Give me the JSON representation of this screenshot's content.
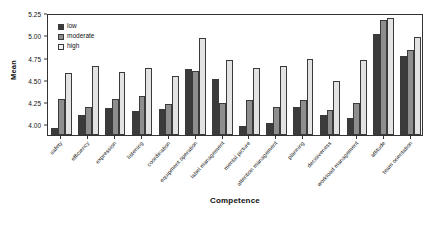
{
  "chart_data": {
    "type": "bar",
    "title": "",
    "xlabel": "Competence",
    "ylabel": "Mean",
    "ylim": [
      3.88,
      5.25
    ],
    "yticks": [
      "4.00",
      "4.25",
      "4.50",
      "4.75",
      "5.00",
      "5.25"
    ],
    "ytick_values": [
      4.0,
      4.25,
      4.5,
      4.75,
      5.0,
      5.25
    ],
    "grid": false,
    "legend_position": "top-left",
    "categories": [
      "safety",
      "efficiency",
      "expression",
      "listening",
      "coordination",
      "equipment operation",
      "label management",
      "mental picture",
      "attention management",
      "planning",
      "decisiveness",
      "workload management",
      "attitude",
      "team orientation"
    ],
    "series": [
      {
        "name": "low",
        "color": "#3b3b3b",
        "values": [
          3.96,
          4.1,
          4.18,
          4.15,
          4.17,
          4.62,
          4.51,
          3.98,
          4.02,
          4.19,
          4.11,
          4.07,
          5.01,
          4.77
        ]
      },
      {
        "name": "moderate",
        "color": "#8e8e8e",
        "values": [
          4.28,
          4.2,
          4.29,
          4.32,
          4.23,
          4.6,
          4.24,
          4.27,
          4.19,
          4.27,
          4.16,
          4.24,
          5.17,
          4.84
        ]
      },
      {
        "name": "high",
        "color": "#e3e3e3",
        "values": [
          4.58,
          4.65,
          4.59,
          4.63,
          4.54,
          4.97,
          4.72,
          4.63,
          4.66,
          4.73,
          4.49,
          4.72,
          5.19,
          4.98
        ]
      }
    ]
  },
  "legend": {
    "items": [
      {
        "label": "low"
      },
      {
        "label": "moderate"
      },
      {
        "label": "high"
      }
    ]
  },
  "axes": {
    "y_title": "Mean",
    "x_title": "Competence"
  }
}
